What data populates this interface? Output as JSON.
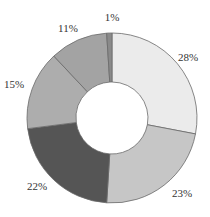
{
  "chart_data": {
    "type": "pie",
    "variant": "donut",
    "title": "",
    "start_angle_deg": 0,
    "direction": "clockwise",
    "slices": [
      {
        "label": "28%",
        "value": 28,
        "color": "#ebebeb"
      },
      {
        "label": "23%",
        "value": 23,
        "color": "#c6c6c6"
      },
      {
        "label": "22%",
        "value": 22,
        "color": "#555555"
      },
      {
        "label": "15%",
        "value": 15,
        "color": "#adadad"
      },
      {
        "label": "11%",
        "value": 11,
        "color": "#a3a3a3"
      },
      {
        "label": "1%",
        "value": 1,
        "color": "#8a8a8a"
      }
    ],
    "legend": null,
    "data_labels": true
  },
  "labels": {
    "s0": "28%",
    "s1": "23%",
    "s2": "22%",
    "s3": "15%",
    "s4": "11%",
    "s5": "1%"
  }
}
